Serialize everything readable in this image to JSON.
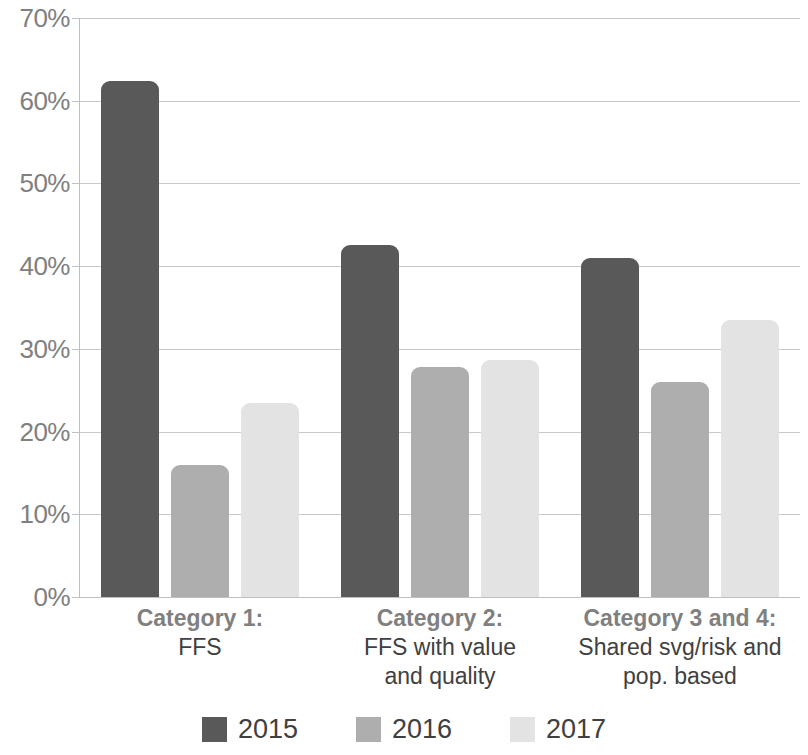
{
  "chart_data": {
    "type": "bar",
    "title": "",
    "subtitle": "",
    "xlabel": "",
    "ylabel": "",
    "ylim": [
      0,
      70
    ],
    "ytick_values": [
      0,
      10,
      20,
      30,
      40,
      50,
      60,
      70
    ],
    "ytick_labels": [
      "0%",
      "10%",
      "20%",
      "30%",
      "40%",
      "50%",
      "60%",
      "70%"
    ],
    "grid": true,
    "value_suffix": "%",
    "legend_position": "bottom",
    "categories": [
      "Category 1:\nFFS",
      "Category 2:\nFFS with value\nand quality",
      "Category 3 and 4:\nShared svg/risk and\npop. based"
    ],
    "category_lines": [
      [
        "Category 1:",
        "FFS"
      ],
      [
        "Category 2:",
        "FFS with value",
        "and quality"
      ],
      [
        "Category 3 and 4:",
        "Shared svg/risk and",
        "pop. based"
      ]
    ],
    "series": [
      {
        "name": "2015",
        "color": "#595959",
        "values": [
          62.4,
          42.5,
          41.0
        ]
      },
      {
        "name": "2016",
        "color": "#aeaeae",
        "values": [
          16.0,
          27.8,
          26.0
        ]
      },
      {
        "name": "2017",
        "color": "#e3e3e3",
        "values": [
          23.5,
          28.6,
          33.5
        ]
      }
    ]
  },
  "legend": {
    "items": [
      {
        "label": "2015",
        "color": "#595959"
      },
      {
        "label": "2016",
        "color": "#aeaeae"
      },
      {
        "label": "2017",
        "color": "#e3e3e3"
      }
    ]
  },
  "axis": {
    "grid_color": "#c9c9c9",
    "axis_color": "#bfbfbf",
    "tick_label_color": "#808080"
  }
}
